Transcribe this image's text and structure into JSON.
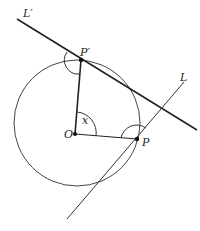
{
  "diagram": {
    "type": "geometry",
    "colors": {
      "stroke": "#222222",
      "background": "#ffffff"
    },
    "labels": {
      "L_prime": "L′",
      "L": "L",
      "P_prime": "P′",
      "P": "P",
      "O": "O",
      "x": "x"
    },
    "points": {
      "O": [
        75,
        134
      ],
      "P": [
        137,
        139
      ],
      "P_prime": [
        81,
        60
      ]
    },
    "circle": {
      "cx": 77,
      "cy": 123,
      "r": 63
    },
    "lines": {
      "L_prime": [
        [
          17,
          19
        ],
        [
          197,
          130
        ]
      ],
      "L": [
        [
          67,
          219
        ],
        [
          184,
          82
        ]
      ]
    }
  }
}
